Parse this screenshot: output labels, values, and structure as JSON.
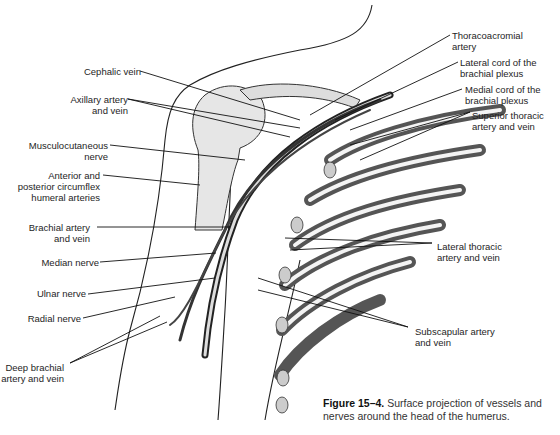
{
  "figure": {
    "caption_number": "Figure 15–4.",
    "caption_text": "Surface projection of vessels and nerves around the head of the humerus."
  },
  "labels_left": {
    "cephalic_vein": "Cephalic vein",
    "axillary_1": "Axillary artery",
    "axillary_2": "and vein",
    "musculo_1": "Musculocutaneous",
    "musculo_2": "nerve",
    "circumflex_1": "Anterior and",
    "circumflex_2": "posterior circumflex",
    "circumflex_3": "humeral arteries",
    "brachial_1": "Brachial artery",
    "brachial_2": "and vein",
    "median": "Median nerve",
    "ulnar": "Ulnar nerve",
    "radial": "Radial nerve",
    "deep_1": "Deep brachial",
    "deep_2": "artery and vein"
  },
  "labels_right": {
    "thoraco_1": "Thoracoacromial",
    "thoraco_2": "artery",
    "lateral_cord_1": "Lateral cord of the",
    "lateral_cord_2": "brachial plexus",
    "medial_cord_1": "Medial cord of the",
    "medial_cord_2": "brachial plexus",
    "sup_thoracic_1": "Superior thoracic",
    "sup_thoracic_2": "artery and vein",
    "lat_thoracic_1": "Lateral thoracic",
    "lat_thoracic_2": "artery and vein",
    "subscap_1": "Subscapular artery",
    "subscap_2": "and vein"
  }
}
